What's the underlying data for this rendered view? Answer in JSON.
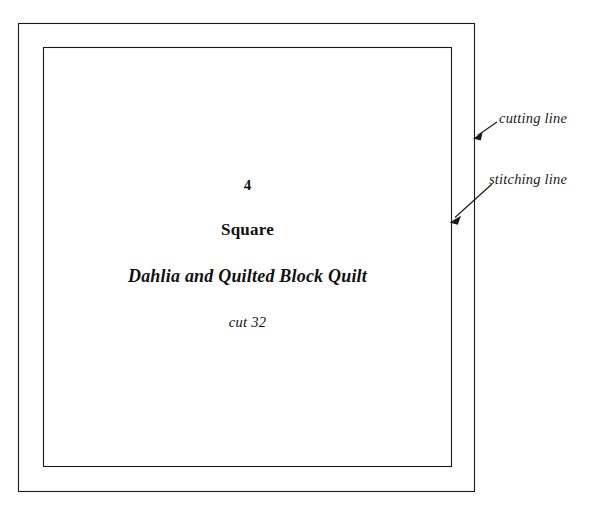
{
  "document": {
    "type": "quilt-pattern-template",
    "background_color": "#ffffff",
    "line_color": "#1a1a1a"
  },
  "template": {
    "piece_number": "4",
    "shape_name": "Square",
    "pattern_name": "Dahlia and Quilted Block Quilt",
    "cut_instruction": "cut 32"
  },
  "annotations": {
    "cutting_line_label": "cutting line",
    "stitching_line_label": "stitching line"
  },
  "shapes": {
    "cutting_rect": {
      "x": 18,
      "y": 23,
      "width": 457,
      "height": 469
    },
    "stitching_rect": {
      "x": 43,
      "y": 47,
      "width": 409,
      "height": 420
    }
  }
}
